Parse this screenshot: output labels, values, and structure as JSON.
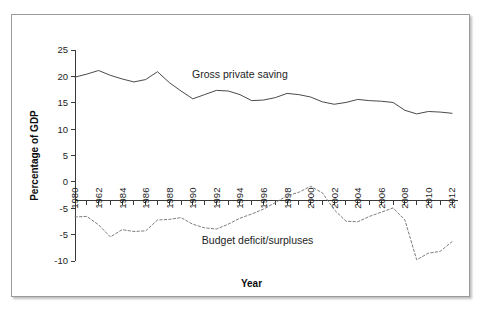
{
  "figure": {
    "xlabel": "Year",
    "ylabel": "Percentage of GDP",
    "series_label_saving": "Gross private saving",
    "series_label_budget": "Budget  deficit/surpluses"
  },
  "axis": {
    "y_tick_labels": [
      "25",
      "20",
      "15",
      "10",
      "5",
      "0",
      "-5",
      "-5",
      "-10"
    ],
    "y_tick_values": [
      25,
      20,
      15,
      10,
      5,
      0,
      -5,
      -5,
      -10
    ],
    "x_tick_labels": [
      "1980",
      "1962",
      "1984",
      "1986",
      "1988",
      "1990",
      "1992",
      "1994",
      "1996",
      "1998",
      "2000",
      "2002",
      "2004",
      "2006",
      "2008",
      "2010",
      "2012"
    ],
    "x_tick_values": [
      1980,
      1982,
      1984,
      1986,
      1988,
      1990,
      1992,
      1994,
      1996,
      1998,
      2000,
      2002,
      2004,
      2006,
      2008,
      2010,
      2012
    ]
  },
  "colors": {
    "saving_line": "#4a4a4a",
    "budget_line": "#7d7d7d",
    "axis": "#3a3a3a",
    "frame": "#9a9a9a",
    "background": "#ffffff"
  },
  "chart_data": {
    "type": "line",
    "title": "",
    "xlabel": "Year",
    "ylabel": "Percentage of GDP",
    "xlim": [
      1980,
      2012
    ],
    "ylim": [
      -10,
      25
    ],
    "grid": false,
    "legend": "inline-annotations",
    "x": [
      1980,
      1981,
      1982,
      1983,
      1984,
      1985,
      1986,
      1987,
      1988,
      1989,
      1990,
      1991,
      1992,
      1993,
      1994,
      1995,
      1996,
      1997,
      1998,
      1999,
      2000,
      2001,
      2002,
      2003,
      2004,
      2005,
      2006,
      2007,
      2008,
      2009,
      2010,
      2011,
      2012
    ],
    "series": [
      {
        "name": "Gross private saving",
        "values": [
          20.5,
          21.0,
          21.6,
          20.8,
          20.2,
          19.7,
          20.1,
          21.4,
          19.6,
          18.2,
          16.9,
          17.6,
          18.3,
          18.2,
          17.6,
          16.6,
          16.7,
          17.1,
          17.8,
          17.6,
          17.2,
          16.4,
          16.0,
          16.3,
          16.8,
          16.6,
          16.5,
          16.3,
          15.0,
          14.4,
          14.8,
          14.7,
          14.5
        ]
      },
      {
        "name": "Budget deficit/surpluses",
        "values": [
          -2.7,
          -2.6,
          -4.0,
          -6.0,
          -4.8,
          -5.1,
          -5.0,
          -3.2,
          -3.1,
          -2.8,
          -3.9,
          -4.5,
          -4.7,
          -3.9,
          -2.9,
          -2.2,
          -1.4,
          -0.3,
          0.8,
          1.4,
          2.4,
          1.3,
          -1.5,
          -3.4,
          -3.5,
          -2.6,
          -1.9,
          -1.2,
          -3.2,
          -9.8,
          -8.7,
          -8.4,
          -6.8
        ]
      }
    ],
    "annotations": [
      {
        "text": "Gross private saving",
        "x": 1994,
        "y": 20.3
      },
      {
        "text": "Budget  deficit/surpluses",
        "x": 1995.5,
        "y": -7.2
      }
    ]
  }
}
